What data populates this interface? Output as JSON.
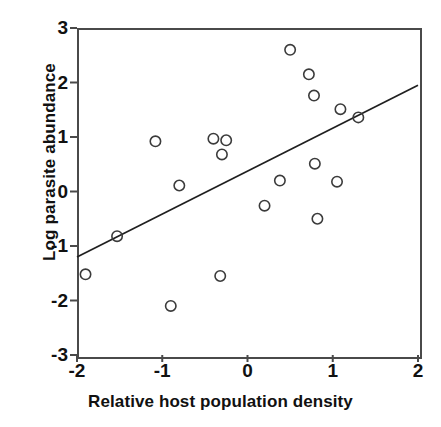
{
  "chart_data": {
    "type": "scatter",
    "title": "",
    "xlabel": "Relative host population density",
    "ylabel": "Log parasite abundance",
    "xlim": [
      -2,
      2
    ],
    "ylim": [
      -3,
      3
    ],
    "xticks": [
      -2,
      -1,
      0,
      1,
      2
    ],
    "yticks": [
      3,
      2,
      1,
      0,
      -1,
      -2,
      -3
    ],
    "xtick_labels": [
      "-2",
      "-1",
      "0",
      "1",
      "2"
    ],
    "ytick_labels": [
      "3",
      "2",
      "1",
      "0",
      "-1",
      "-2",
      "-3"
    ],
    "grid": false,
    "legend": null,
    "marker": "open-circle",
    "marker_color": "#3b3b3b",
    "marker_fill": "none",
    "points": [
      {
        "x": -1.9,
        "y": -1.52
      },
      {
        "x": -1.53,
        "y": -0.82
      },
      {
        "x": -1.08,
        "y": 0.92
      },
      {
        "x": -0.9,
        "y": -2.1
      },
      {
        "x": -0.8,
        "y": 0.11
      },
      {
        "x": -0.4,
        "y": 0.97
      },
      {
        "x": -0.32,
        "y": -1.55
      },
      {
        "x": -0.3,
        "y": 0.68
      },
      {
        "x": -0.25,
        "y": 0.94
      },
      {
        "x": 0.2,
        "y": -0.26
      },
      {
        "x": 0.38,
        "y": 0.2
      },
      {
        "x": 0.5,
        "y": 2.6
      },
      {
        "x": 0.72,
        "y": 2.15
      },
      {
        "x": 0.78,
        "y": 1.76
      },
      {
        "x": 0.79,
        "y": 0.51
      },
      {
        "x": 0.82,
        "y": -0.5
      },
      {
        "x": 1.05,
        "y": 0.18
      },
      {
        "x": 1.09,
        "y": 1.51
      },
      {
        "x": 1.3,
        "y": 1.36
      }
    ],
    "trend_line": {
      "x_start": -2.0,
      "y_start": -1.2,
      "x_end": 2.0,
      "y_end": 1.95,
      "color": "#1f1f1f"
    }
  },
  "axes": {
    "frame_color": "#4a4a4a"
  }
}
